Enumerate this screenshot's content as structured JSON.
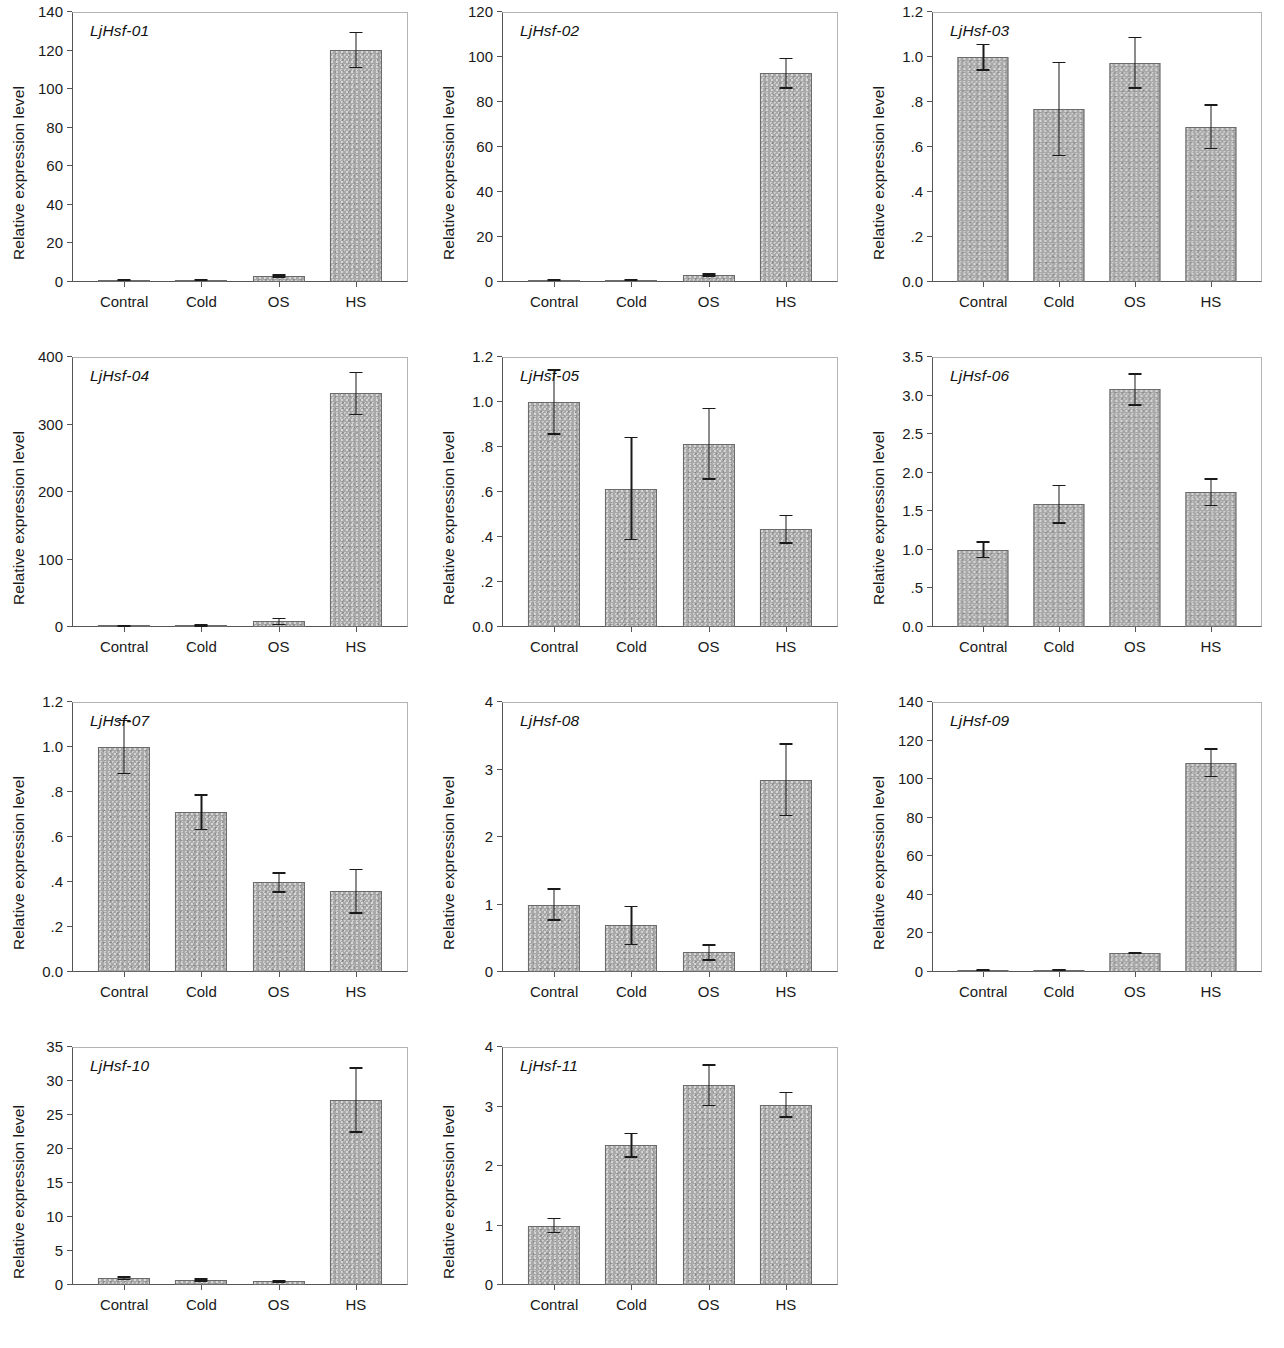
{
  "figure": {
    "axis_y_title": "Relative expression level",
    "categories": [
      "Contral",
      "Cold",
      "OS",
      "HS"
    ],
    "bar_color": "#a8a8a8",
    "bar_edge_color": "#6a6a6a",
    "error_bar_color": "#1a1a1a",
    "panel_count": 11,
    "grid": "off",
    "legend": "none"
  },
  "chart_data": [
    {
      "type": "bar",
      "title": "LjHsf-01",
      "xlabel": "",
      "ylabel": "Relative expression level",
      "categories": [
        "Contral",
        "Cold",
        "OS",
        "HS"
      ],
      "values": [
        1.0,
        1.1,
        3.2,
        120.3
      ],
      "errors": [
        0.6,
        0.7,
        0.9,
        9.5
      ],
      "ylim": [
        0,
        140
      ],
      "yticks": [
        0,
        20,
        40,
        60,
        80,
        100,
        120,
        140
      ],
      "ytick_labels": [
        "0",
        "20",
        "40",
        "60",
        "80",
        "100",
        "120",
        "140"
      ]
    },
    {
      "type": "bar",
      "title": "LjHsf-02",
      "xlabel": "",
      "ylabel": "Relative expression level",
      "categories": [
        "Contral",
        "Cold",
        "OS",
        "HS"
      ],
      "values": [
        1.0,
        1.0,
        3.1,
        92.8
      ],
      "errors": [
        0.5,
        0.5,
        0.7,
        6.9
      ],
      "ylim": [
        0,
        120
      ],
      "yticks": [
        0,
        20,
        40,
        60,
        80,
        100,
        120
      ],
      "ytick_labels": [
        "0",
        "20",
        "40",
        "60",
        "80",
        "100",
        "120"
      ]
    },
    {
      "type": "bar",
      "title": "LjHsf-03",
      "xlabel": "",
      "ylabel": "Relative expression level",
      "categories": [
        "Contral",
        "Cold",
        "OS",
        "HS"
      ],
      "values": [
        1.0,
        0.77,
        0.975,
        0.69
      ],
      "errors": [
        0.06,
        0.21,
        0.115,
        0.1
      ],
      "ylim": [
        0,
        1.2
      ],
      "yticks": [
        0,
        0.2,
        0.4,
        0.6,
        0.8,
        1.0,
        1.2
      ],
      "ytick_labels": [
        "0.0",
        ".2",
        ".4",
        ".6",
        ".8",
        "1.0",
        "1.2"
      ]
    },
    {
      "type": "bar",
      "title": "LjHsf-04",
      "xlabel": "",
      "ylabel": "Relative expression level",
      "categories": [
        "Contral",
        "Cold",
        "OS",
        "HS"
      ],
      "values": [
        1.5,
        2.0,
        8.5,
        346.0
      ],
      "errors": [
        1.5,
        1.8,
        5.5,
        32.0
      ],
      "ylim": [
        0,
        400
      ],
      "yticks": [
        0,
        100,
        200,
        300,
        400
      ],
      "ytick_labels": [
        "0",
        "100",
        "200",
        "300",
        "400"
      ]
    },
    {
      "type": "bar",
      "title": "LjHsf-05",
      "xlabel": "",
      "ylabel": "Relative expression level",
      "categories": [
        "Contral",
        "Cold",
        "OS",
        "HS"
      ],
      "values": [
        1.0,
        0.615,
        0.815,
        0.435
      ],
      "errors": [
        0.145,
        0.23,
        0.16,
        0.065
      ],
      "ylim": [
        0,
        1.2
      ],
      "yticks": [
        0,
        0.2,
        0.4,
        0.6,
        0.8,
        1.0,
        1.2
      ],
      "ytick_labels": [
        "0.0",
        ".2",
        ".4",
        ".6",
        ".8",
        "1.0",
        "1.2"
      ]
    },
    {
      "type": "bar",
      "title": "LjHsf-06",
      "xlabel": "",
      "ylabel": "Relative expression level",
      "categories": [
        "Contral",
        "Cold",
        "OS",
        "HS"
      ],
      "values": [
        1.0,
        1.59,
        3.08,
        1.75
      ],
      "errors": [
        0.11,
        0.25,
        0.21,
        0.18
      ],
      "ylim": [
        0,
        3.5
      ],
      "yticks": [
        0,
        0.5,
        1.0,
        1.5,
        2.0,
        2.5,
        3.0,
        3.5
      ],
      "ytick_labels": [
        "0.0",
        ".5",
        "1.0",
        "1.5",
        "2.0",
        "2.5",
        "3.0",
        "3.5"
      ]
    },
    {
      "type": "bar",
      "title": "LjHsf-07",
      "xlabel": "",
      "ylabel": "Relative expression level",
      "categories": [
        "Contral",
        "Cold",
        "OS",
        "HS"
      ],
      "values": [
        1.0,
        0.71,
        0.398,
        0.36
      ],
      "errors": [
        0.12,
        0.08,
        0.045,
        0.1
      ],
      "ylim": [
        0,
        1.2
      ],
      "yticks": [
        0,
        0.2,
        0.4,
        0.6,
        0.8,
        1.0,
        1.2
      ],
      "ytick_labels": [
        "0.0",
        ".2",
        ".4",
        ".6",
        ".8",
        "1.0",
        "1.2"
      ]
    },
    {
      "type": "bar",
      "title": "LjHsf-08",
      "xlabel": "",
      "ylabel": "Relative expression level",
      "categories": [
        "Contral",
        "Cold",
        "OS",
        "HS"
      ],
      "values": [
        1.0,
        0.69,
        0.29,
        2.85
      ],
      "errors": [
        0.24,
        0.29,
        0.12,
        0.54
      ],
      "ylim": [
        0,
        4
      ],
      "yticks": [
        0,
        1,
        2,
        3,
        4
      ],
      "ytick_labels": [
        "0",
        "1",
        "2",
        "3",
        "4"
      ]
    },
    {
      "type": "bar",
      "title": "LjHsf-09",
      "xlabel": "",
      "ylabel": "Relative expression level",
      "categories": [
        "Contral",
        "Cold",
        "OS",
        "HS"
      ],
      "values": [
        1.0,
        1.2,
        9.8,
        108.5
      ],
      "errors": [
        0.5,
        0.6,
        0.6,
        7.5
      ],
      "ylim": [
        0,
        140
      ],
      "yticks": [
        0,
        20,
        40,
        60,
        80,
        100,
        120,
        140
      ],
      "ytick_labels": [
        "0",
        "20",
        "40",
        "60",
        "80",
        "100",
        "120",
        "140"
      ]
    },
    {
      "type": "bar",
      "title": "LjHsf-10",
      "xlabel": "",
      "ylabel": "Relative expression level",
      "categories": [
        "Contral",
        "Cold",
        "OS",
        "HS"
      ],
      "values": [
        1.0,
        0.75,
        0.55,
        27.2
      ],
      "errors": [
        0.3,
        0.25,
        0.2,
        4.8
      ],
      "ylim": [
        0,
        35
      ],
      "yticks": [
        0,
        5,
        10,
        15,
        20,
        25,
        30,
        35
      ],
      "ytick_labels": [
        "0",
        "5",
        "10",
        "15",
        "20",
        "25",
        "30",
        "35"
      ]
    },
    {
      "type": "bar",
      "title": "LjHsf-11",
      "xlabel": "",
      "ylabel": "Relative expression level",
      "categories": [
        "Contral",
        "Cold",
        "OS",
        "HS"
      ],
      "values": [
        1.0,
        2.35,
        3.36,
        3.03
      ],
      "errors": [
        0.13,
        0.21,
        0.35,
        0.22
      ],
      "ylim": [
        0,
        4
      ],
      "yticks": [
        0,
        1,
        2,
        3,
        4
      ],
      "ytick_labels": [
        "0",
        "1",
        "2",
        "3",
        "4"
      ]
    }
  ]
}
